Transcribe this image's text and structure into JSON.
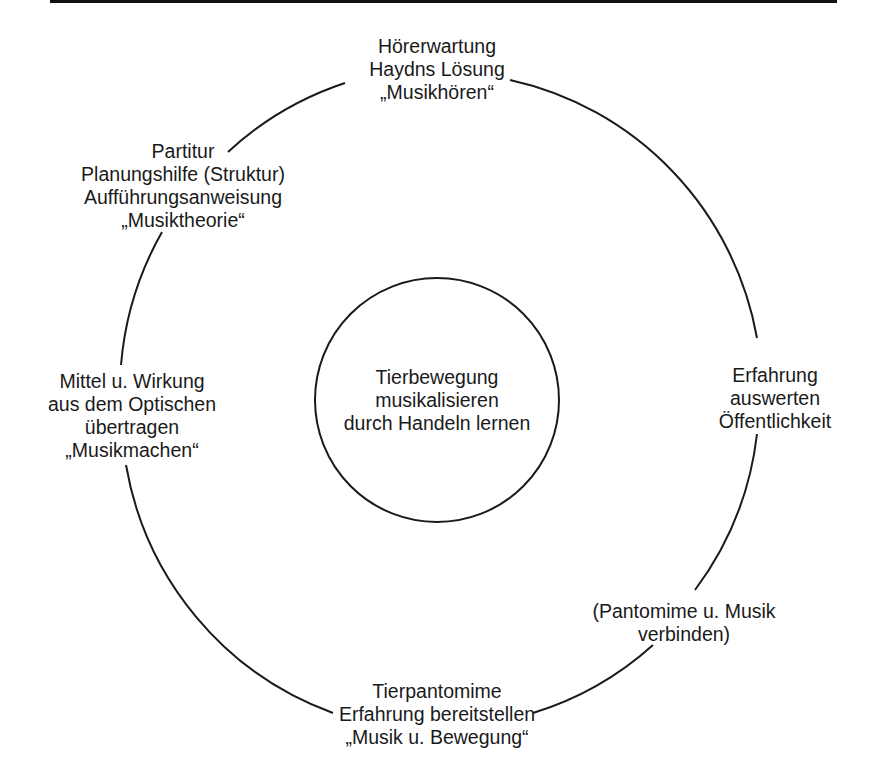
{
  "diagram": {
    "center": {
      "lines": [
        "Tierbewegung",
        "musikalisieren",
        "durch Handeln lernen"
      ]
    },
    "nodes": {
      "top": {
        "lines": [
          "Hörerwartung",
          "Haydns Lösung",
          "„Musikhören“"
        ]
      },
      "upper_left": {
        "lines": [
          "Partitur",
          "Planungshilfe (Struktur)",
          "Aufführungsanweisung",
          "„Musiktheorie“"
        ]
      },
      "left": {
        "lines": [
          "Mittel u. Wirkung",
          "aus dem Optischen",
          "übertragen",
          "„Musikmachen“"
        ]
      },
      "right": {
        "lines": [
          "Erfahrung",
          "auswerten",
          "Öffentlichkeit"
        ]
      },
      "lower_right": {
        "lines": [
          "(Pantomime u. Musik",
          "verbinden)"
        ]
      },
      "bottom": {
        "lines": [
          "Tierpantomime",
          "Erfahrung bereitstellen",
          "„Musik u. Bewegung“"
        ]
      }
    },
    "colors": {
      "line": "#1a1a1a",
      "background": "#ffffff"
    }
  }
}
